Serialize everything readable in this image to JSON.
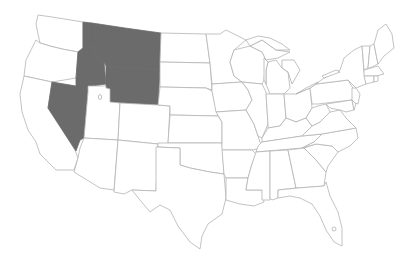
{
  "map": {
    "title": "",
    "region": "Contiguous United States",
    "style": "state outline map",
    "colors": {
      "background": "#ffffff",
      "state_fill": "#ffffff",
      "state_border": "#b4b4b4",
      "highlight_fill": "#6b6b6b"
    },
    "highlighted_states": [
      "Idaho",
      "Montana",
      "Wyoming",
      "Nevada"
    ],
    "states": [
      {
        "id": "WA",
        "name": "Washington",
        "highlighted": false
      },
      {
        "id": "OR",
        "name": "Oregon",
        "highlighted": false
      },
      {
        "id": "CA",
        "name": "California",
        "highlighted": false
      },
      {
        "id": "ID",
        "name": "Idaho",
        "highlighted": true
      },
      {
        "id": "MT",
        "name": "Montana",
        "highlighted": true
      },
      {
        "id": "WY",
        "name": "Wyoming",
        "highlighted": true
      },
      {
        "id": "NV",
        "name": "Nevada",
        "highlighted": true
      },
      {
        "id": "UT",
        "name": "Utah",
        "highlighted": false
      },
      {
        "id": "CO",
        "name": "Colorado",
        "highlighted": false
      },
      {
        "id": "AZ",
        "name": "Arizona",
        "highlighted": false
      },
      {
        "id": "NM",
        "name": "New Mexico",
        "highlighted": false
      },
      {
        "id": "ND",
        "name": "North Dakota",
        "highlighted": false
      },
      {
        "id": "SD",
        "name": "South Dakota",
        "highlighted": false
      },
      {
        "id": "NE",
        "name": "Nebraska",
        "highlighted": false
      },
      {
        "id": "KS",
        "name": "Kansas",
        "highlighted": false
      },
      {
        "id": "OK",
        "name": "Oklahoma",
        "highlighted": false
      },
      {
        "id": "TX",
        "name": "Texas",
        "highlighted": false
      },
      {
        "id": "MN",
        "name": "Minnesota",
        "highlighted": false
      },
      {
        "id": "IA",
        "name": "Iowa",
        "highlighted": false
      },
      {
        "id": "MO",
        "name": "Missouri",
        "highlighted": false
      },
      {
        "id": "AR",
        "name": "Arkansas",
        "highlighted": false
      },
      {
        "id": "LA",
        "name": "Louisiana",
        "highlighted": false
      },
      {
        "id": "WI",
        "name": "Wisconsin",
        "highlighted": false
      },
      {
        "id": "IL",
        "name": "Illinois",
        "highlighted": false
      },
      {
        "id": "MI",
        "name": "Michigan",
        "highlighted": false
      },
      {
        "id": "IN",
        "name": "Indiana",
        "highlighted": false
      },
      {
        "id": "OH",
        "name": "Ohio",
        "highlighted": false
      },
      {
        "id": "KY",
        "name": "Kentucky",
        "highlighted": false
      },
      {
        "id": "TN",
        "name": "Tennessee",
        "highlighted": false
      },
      {
        "id": "MS",
        "name": "Mississippi",
        "highlighted": false
      },
      {
        "id": "AL",
        "name": "Alabama",
        "highlighted": false
      },
      {
        "id": "GA",
        "name": "Georgia",
        "highlighted": false
      },
      {
        "id": "FL",
        "name": "Florida",
        "highlighted": false
      },
      {
        "id": "SC",
        "name": "South Carolina",
        "highlighted": false
      },
      {
        "id": "NC",
        "name": "North Carolina",
        "highlighted": false
      },
      {
        "id": "VA",
        "name": "Virginia",
        "highlighted": false
      },
      {
        "id": "WV",
        "name": "West Virginia",
        "highlighted": false
      },
      {
        "id": "PA",
        "name": "Pennsylvania",
        "highlighted": false
      },
      {
        "id": "NY",
        "name": "New York",
        "highlighted": false
      },
      {
        "id": "VT",
        "name": "Vermont",
        "highlighted": false
      },
      {
        "id": "NH",
        "name": "New Hampshire",
        "highlighted": false
      },
      {
        "id": "ME",
        "name": "Maine",
        "highlighted": false
      },
      {
        "id": "MA",
        "name": "Massachusetts",
        "highlighted": false
      },
      {
        "id": "CT",
        "name": "Connecticut",
        "highlighted": false
      },
      {
        "id": "RI",
        "name": "Rhode Island",
        "highlighted": false
      },
      {
        "id": "NJ",
        "name": "New Jersey",
        "highlighted": false
      },
      {
        "id": "DE",
        "name": "Delaware",
        "highlighted": false
      },
      {
        "id": "MD",
        "name": "Maryland",
        "highlighted": false
      }
    ]
  }
}
